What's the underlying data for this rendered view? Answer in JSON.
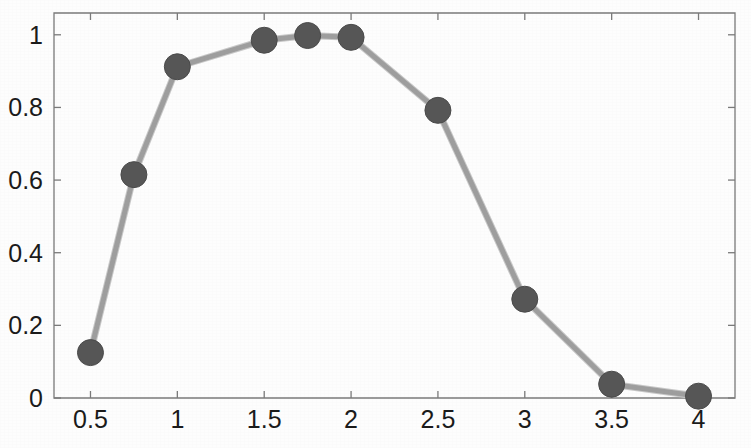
{
  "chart_data": {
    "type": "line",
    "title": "",
    "xlabel": "",
    "ylabel": "",
    "x": [
      0.5,
      0.75,
      1,
      1.5,
      1.75,
      2,
      2.5,
      3,
      3.5,
      4
    ],
    "values": [
      0.125,
      0.615,
      0.912,
      0.985,
      0.998,
      0.993,
      0.792,
      0.272,
      0.038,
      0.005
    ],
    "series": [
      {
        "name": "series-1",
        "x": [
          0.5,
          0.75,
          1,
          1.5,
          1.75,
          2,
          2.5,
          3,
          3.5,
          4
        ],
        "values": [
          0.125,
          0.615,
          0.912,
          0.985,
          0.998,
          0.993,
          0.792,
          0.272,
          0.038,
          0.005
        ]
      }
    ],
    "xlim": [
      0.29,
      4.21
    ],
    "ylim": [
      0,
      1.06
    ],
    "xticks": [
      0.5,
      1,
      1.5,
      2,
      2.5,
      3,
      3.5,
      4
    ],
    "xticklabels": [
      "0.5",
      "1",
      "1.5",
      "2",
      "2.5",
      "3",
      "3.5",
      "4"
    ],
    "yticks": [
      0,
      0.2,
      0.4,
      0.6,
      0.8,
      1
    ],
    "yticklabels": [
      "0",
      "0.2",
      "0.4",
      "0.6",
      "0.8",
      "1"
    ],
    "grid": false,
    "legend": null,
    "marker": "circle",
    "marker_color": "#565656",
    "marker_size": 13,
    "line_color": "#9e9e9e",
    "line_width": 5,
    "axis_color": "#7a7a7a",
    "background_color": "#fdfdfd"
  }
}
